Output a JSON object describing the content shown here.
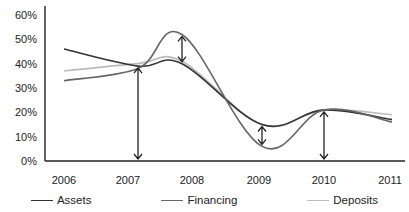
{
  "chart_data": {
    "type": "line",
    "title": "",
    "xlabel": "",
    "ylabel": "",
    "x": [
      "2006",
      "2007",
      "2008",
      "2009",
      "2010",
      "2011"
    ],
    "y_ticks": [
      "0%",
      "10%",
      "20%",
      "30%",
      "40%",
      "50%",
      "60%"
    ],
    "ylim": [
      0,
      60
    ],
    "grid": false,
    "legend_position": "bottom",
    "series": [
      {
        "name": "Assets",
        "color": "#333333",
        "values": [
          46,
          39,
          40,
          15,
          21,
          17
        ]
      },
      {
        "name": "Financing",
        "color": "#666666",
        "values": [
          33,
          38,
          52,
          6,
          21,
          16
        ]
      },
      {
        "name": "Deposits",
        "color": "#bbbbbb",
        "values": [
          37,
          40,
          41,
          15,
          21,
          19
        ]
      }
    ],
    "annotations": [
      {
        "type": "double-arrow",
        "x": "2007",
        "from": 0,
        "to": 39
      },
      {
        "type": "double-arrow",
        "x": "2008",
        "from": 40,
        "to": 52
      },
      {
        "type": "double-arrow",
        "x": "2009",
        "from": 6,
        "to": 15
      },
      {
        "type": "double-arrow",
        "x": "2010",
        "from": 0,
        "to": 21
      }
    ]
  },
  "legend": {
    "items": [
      {
        "label": "Assets",
        "color": "#333333"
      },
      {
        "label": "Financing",
        "color": "#666666"
      },
      {
        "label": "Deposits",
        "color": "#bbbbbb"
      }
    ]
  }
}
